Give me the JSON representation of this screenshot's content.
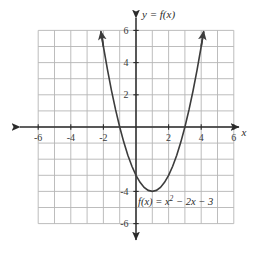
{
  "figure": {
    "title_label": "y = f(x)",
    "x_axis_label": "x",
    "equation_plain": "f(x) = x2 - 2x - 3",
    "equation_parts": {
      "fx": "f(x) = x",
      "exponent": "2",
      "rest": " − 2x − 3"
    }
  },
  "colors": {
    "grid": "#b6b6b6",
    "axis": "#2b2b2b",
    "curve": "#3c3c3c",
    "text": "#2b2b2b",
    "background": "#ffffff"
  },
  "chart_data": {
    "type": "line",
    "title": "y = f(x)",
    "annotations": [
      "y = f(x)",
      "f(x) = x² − 2x − 3"
    ],
    "function": "f(x) = x^2 - 2x - 3",
    "xlabel": "x",
    "ylabel": "y",
    "xlim": [
      -6,
      6
    ],
    "ylim": [
      -6,
      6
    ],
    "grid": true,
    "grid_step": 1,
    "legend_position": "none",
    "x_tick_labels": [
      "-6",
      "-4",
      "-2",
      "2",
      "4",
      "6"
    ],
    "x_tick_values": [
      -6,
      -4,
      -2,
      2,
      4,
      6
    ],
    "y_tick_labels": [
      "6",
      "4",
      "2",
      "-4",
      "-6"
    ],
    "y_tick_values": [
      6,
      4,
      2,
      -4,
      -6
    ],
    "vertex": [
      1,
      -4
    ],
    "x_intercepts": [
      -1,
      3
    ],
    "y_intercept": -3,
    "series": [
      {
        "name": "f(x) = x² − 2x − 3",
        "arrows": "both",
        "x": [
          -2.15,
          -2.0,
          -1.75,
          -1.5,
          -1.25,
          -1.0,
          -0.75,
          -0.5,
          -0.25,
          0.0,
          0.25,
          0.5,
          0.75,
          1.0,
          1.25,
          1.5,
          1.75,
          2.0,
          2.25,
          2.5,
          2.75,
          3.0,
          3.25,
          3.5,
          3.75,
          4.0,
          4.15
        ],
        "y": [
          5.92,
          5.0,
          3.5625,
          2.25,
          1.0625,
          0.0,
          -0.9375,
          -1.75,
          -2.4375,
          -3.0,
          -3.4375,
          -3.75,
          -3.9375,
          -4.0,
          -3.9375,
          -3.75,
          -3.4375,
          -3.0,
          -2.4375,
          -1.75,
          -0.9375,
          0.0,
          1.0625,
          2.25,
          3.5625,
          5.0,
          5.92
        ]
      }
    ]
  }
}
